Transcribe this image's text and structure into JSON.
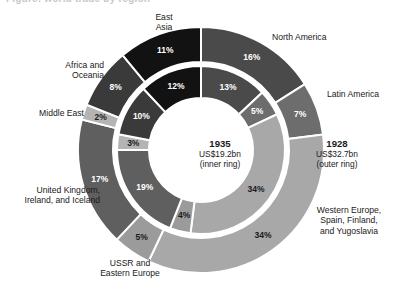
{
  "figure": {
    "caption_remnant": "Figure: world trade by region"
  },
  "center": {
    "inner": {
      "year": "1935",
      "amount": "US$19.2bn",
      "ring_note": "(inner ring)"
    },
    "outer": {
      "year": "1928",
      "amount": "US$32.7bn",
      "ring_note": "(outer ring)"
    }
  },
  "labels": {
    "north_america": "North America",
    "latin_america": "Latin America",
    "western_europe": "Western Europe,\nSpain, Finland,\nand Yugoslavia",
    "ussr": "USSR and\nEastern Europe",
    "uk": "United Kingdom,\nIreland, and Iceland",
    "middle_east": "Middle East",
    "africa_oceania": "Africa and\nOceania",
    "east_asia": "East\nAsia"
  },
  "chart_data": {
    "type": "pie",
    "subtype": "nested-donut",
    "legend_position": "inline-labels",
    "rings": [
      {
        "name": "outer",
        "label": "1928",
        "total": "US$32.7bn"
      },
      {
        "name": "inner",
        "label": "1935",
        "total": "US$19.2bn"
      }
    ],
    "categories": [
      "North America",
      "Latin America",
      "Western Europe, Spain, Finland, and Yugoslavia",
      "USSR and Eastern Europe",
      "United Kingdom, Ireland, and Iceland",
      "Middle East",
      "Africa and Oceania",
      "East Asia"
    ],
    "series": [
      {
        "name": "1928 (outer ring)",
        "values": [
          16,
          7,
          34,
          5,
          17,
          2,
          8,
          11
        ]
      },
      {
        "name": "1935 (inner ring)",
        "values": [
          13,
          5,
          34,
          4,
          19,
          3,
          10,
          12
        ]
      }
    ],
    "value_labels": {
      "outer": [
        "16%",
        "7%",
        "34%",
        "5%",
        "17%",
        "2%",
        "8%",
        "11%"
      ],
      "inner": [
        "13%",
        "5%",
        "34%",
        "4%",
        "19%",
        "3%",
        "10%",
        "12%"
      ]
    },
    "colors": [
      "#4a4a4a",
      "#6d6d6d",
      "#a8a8a8",
      "#9b9b9b",
      "#5f5f5f",
      "#b4b4b4",
      "#3a3a3a",
      "#121212"
    ],
    "separator_color": "#ffffff",
    "background": "#ffffff",
    "start_angle_deg": 0,
    "direction": "clockwise"
  }
}
